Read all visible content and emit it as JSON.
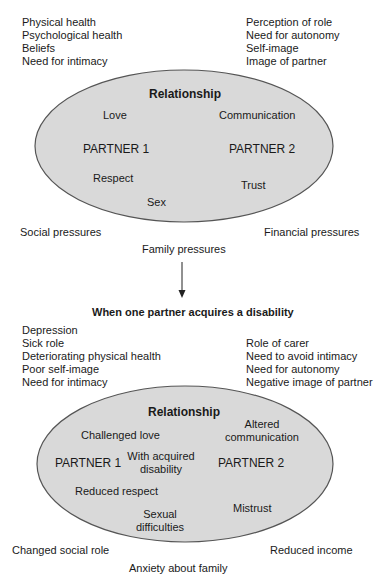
{
  "colors": {
    "ellipse_fill": "#d9d9d9",
    "ellipse_stroke": "#555555",
    "text": "#1a1a1a",
    "arrow": "#222222"
  },
  "before": {
    "partner1_needs": [
      "Physical health",
      "Psychological health",
      "Beliefs",
      "Need for intimacy"
    ],
    "partner2_needs": [
      "Perception of role",
      "Need for autonomy",
      "Self-image",
      "Image of partner"
    ],
    "ellipse": {
      "title": "Relationship",
      "love": "Love",
      "communication": "Communication",
      "partner1": "PARTNER 1",
      "partner2": "PARTNER 2",
      "respect": "Respect",
      "trust": "Trust",
      "sex": "Sex"
    },
    "pressures": {
      "social": "Social pressures",
      "financial": "Financial pressures",
      "family": "Family pressures"
    }
  },
  "arrow": {
    "icon": "arrow-down-icon"
  },
  "after": {
    "heading": "When one partner acquires a disability",
    "partner1_needs": [
      "Depression",
      "Sick role",
      "Deteriorating physical health",
      "Poor self-image",
      "Need for intimacy"
    ],
    "partner2_needs": [
      "Role of carer",
      "Need to avoid intimacy",
      "Need for autonomy",
      "Negative image of partner"
    ],
    "ellipse": {
      "title": "Relationship",
      "challenged_love": "Challenged love",
      "altered_communication_1": "Altered",
      "altered_communication_2": "communication",
      "partner1": "PARTNER 1",
      "with_disability_1": "With acquired",
      "with_disability_2": "disability",
      "partner2": "PARTNER 2",
      "reduced_respect": "Reduced respect",
      "mistrust": "Mistrust",
      "sexual_1": "Sexual",
      "sexual_2": "difficulties"
    },
    "pressures": {
      "social": "Changed social role",
      "financial": "Reduced income",
      "family": "Anxiety about family"
    }
  }
}
